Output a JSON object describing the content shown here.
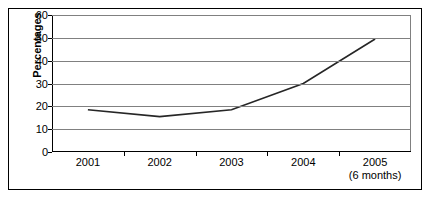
{
  "chart_data": {
    "type": "line",
    "title": "",
    "xlabel": "",
    "ylabel": "Percentages",
    "categories": [
      "2001",
      "2002",
      "2003",
      "2004",
      "2005"
    ],
    "category_sublabels": [
      "",
      "",
      "",
      "",
      "(6 months)"
    ],
    "values": [
      18.5,
      15.5,
      18.5,
      30,
      49.5
    ],
    "series": [
      {
        "name": "Percentages",
        "values": [
          18.5,
          15.5,
          18.5,
          30,
          49.5
        ]
      }
    ],
    "ylim": [
      0,
      60
    ],
    "ytick_labels": [
      "0",
      "10",
      "20",
      "30",
      "40",
      "50",
      "60"
    ],
    "ytick_values": [
      0,
      10,
      20,
      30,
      40,
      50,
      60
    ],
    "grid": "horizontal",
    "legend": "none",
    "line_color": "#262626",
    "gridline_color": "#808080",
    "axis_color": "#000000",
    "background_color": "#ffffff",
    "border_color": "#000000"
  }
}
